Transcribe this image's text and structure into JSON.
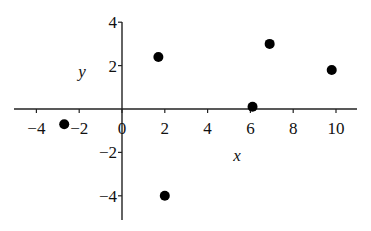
{
  "chart_data": {
    "type": "scatter",
    "title": "",
    "xlabel": "x",
    "ylabel": "y",
    "xlim": [
      -5,
      11
    ],
    "ylim": [
      -5,
      4
    ],
    "x_ticks": [
      -4,
      -2,
      0,
      2,
      4,
      6,
      8,
      10
    ],
    "x_tick_labels": [
      "-4",
      "-2",
      "0",
      "2",
      "4",
      "6",
      "8",
      "10"
    ],
    "y_ticks": [
      4,
      2,
      -2,
      -4
    ],
    "y_tick_labels": [
      "4",
      "2",
      "-2",
      "-4"
    ],
    "grid": false,
    "legend": null,
    "marker": "filled-circle",
    "marker_color": "#000000",
    "series": [
      {
        "name": "points",
        "x": [
          -2.7,
          1.7,
          2,
          6.1,
          6.9,
          9.8
        ],
        "y": [
          -0.7,
          2.4,
          -4,
          0.1,
          3.0,
          1.8
        ]
      }
    ]
  },
  "layout": {
    "origin_px": [
      122,
      109
    ],
    "x_px_per_unit": 21.4,
    "y_px_per_unit": 21.7,
    "x_axis_px_range": [
      14,
      357
    ],
    "y_axis_px_range": [
      22,
      220
    ],
    "x_label_px": [
      237,
      161
    ],
    "y_label_px": [
      82,
      77
    ]
  }
}
